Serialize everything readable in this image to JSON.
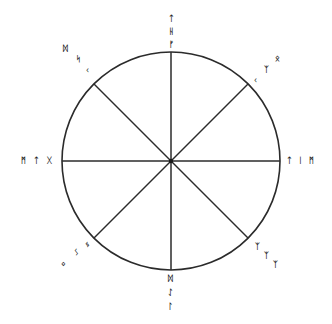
{
  "diagram": {
    "type": "eight-direction-wheel",
    "stroke_color": "#2b2b2b",
    "background_color": "#ffffff",
    "circle": {
      "cx": 171,
      "cy": 161,
      "r": 109
    },
    "spokes": [
      {
        "direction": "N",
        "glyphs": [
          "ᛏ",
          "ᚺ",
          "ᚠ"
        ]
      },
      {
        "direction": "NE",
        "glyphs": [
          "ᚲ",
          "ᛉ",
          "ᛟ"
        ]
      },
      {
        "direction": "E",
        "glyphs": [
          "ᛏ",
          "ᛁ",
          "ᛗ"
        ]
      },
      {
        "direction": "SE",
        "glyphs": [
          "ᛉ",
          "ᛉ",
          "ᛉ"
        ]
      },
      {
        "direction": "S",
        "glyphs": [
          "ᛞ",
          "ᛇ",
          "ᛚ"
        ]
      },
      {
        "direction": "SW",
        "glyphs": [
          "ᛃ",
          "ᛊ",
          "ᛜ"
        ]
      },
      {
        "direction": "W",
        "glyphs": [
          "ᛗ",
          "ᛏ",
          "ᚷ"
        ]
      },
      {
        "direction": "NW",
        "glyphs": [
          "ᚲ",
          "ᛋ",
          "ᛞ"
        ]
      }
    ]
  }
}
